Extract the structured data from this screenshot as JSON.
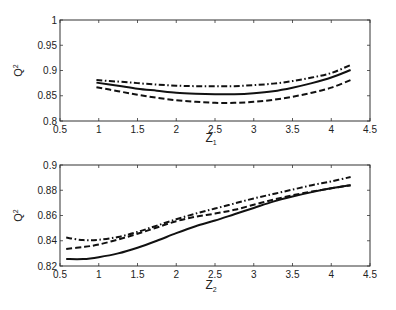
{
  "chart_data": [
    {
      "type": "line",
      "title": "",
      "xlabel": "Z",
      "xlabel_sub": "1",
      "ylabel": "Q",
      "ylabel_sup": "2",
      "xlim": [
        0.5,
        4.5
      ],
      "ylim": [
        0.8,
        1.0
      ],
      "xticks": [
        0.5,
        1,
        1.5,
        2,
        2.5,
        3,
        3.5,
        4,
        4.5
      ],
      "yticks": [
        0.8,
        0.85,
        0.9,
        0.95,
        1
      ],
      "xtick_labels": [
        "0.5",
        "1",
        "1.5",
        "2",
        "2.5",
        "3",
        "3.5",
        "4",
        "4.5"
      ],
      "ytick_labels": [
        "0.8",
        "0.85",
        "0.9",
        "0.95",
        "1"
      ],
      "grid": false,
      "legend": null,
      "x": [
        0.97,
        1.25,
        1.5,
        1.75,
        2.0,
        2.25,
        2.5,
        2.75,
        3.0,
        3.25,
        3.5,
        3.75,
        4.0,
        4.25
      ],
      "series": [
        {
          "name": "dash-dot",
          "style": "dashdot",
          "values": [
            0.881,
            0.878,
            0.875,
            0.872,
            0.87,
            0.869,
            0.869,
            0.869,
            0.871,
            0.874,
            0.879,
            0.886,
            0.895,
            0.911
          ]
        },
        {
          "name": "solid",
          "style": "solid",
          "values": [
            0.876,
            0.87,
            0.864,
            0.86,
            0.856,
            0.854,
            0.853,
            0.853,
            0.855,
            0.859,
            0.866,
            0.875,
            0.886,
            0.901
          ]
        },
        {
          "name": "dashed",
          "style": "dashed",
          "values": [
            0.867,
            0.859,
            0.852,
            0.846,
            0.841,
            0.838,
            0.836,
            0.836,
            0.838,
            0.842,
            0.848,
            0.856,
            0.866,
            0.881
          ]
        }
      ]
    },
    {
      "type": "line",
      "title": "",
      "xlabel": "Z",
      "xlabel_sub": "2",
      "ylabel": "Q",
      "ylabel_sup": "2",
      "xlim": [
        0.5,
        4.5
      ],
      "ylim": [
        0.82,
        0.9
      ],
      "xticks": [
        0.5,
        1,
        1.5,
        2,
        2.5,
        3,
        3.5,
        4,
        4.5
      ],
      "yticks": [
        0.82,
        0.84,
        0.86,
        0.88,
        0.9
      ],
      "xtick_labels": [
        "0.5",
        "1",
        "1.5",
        "2",
        "2.5",
        "3",
        "3.5",
        "4",
        "4.5"
      ],
      "ytick_labels": [
        "0.82",
        "0.84",
        "0.86",
        "0.88",
        "0.9"
      ],
      "grid": false,
      "legend": null,
      "x": [
        0.58,
        0.8,
        1.0,
        1.25,
        1.5,
        1.75,
        2.0,
        2.25,
        2.5,
        2.75,
        3.0,
        3.25,
        3.5,
        3.75,
        4.0,
        4.25
      ],
      "series": [
        {
          "name": "dash-dot",
          "style": "dashdot",
          "values": [
            0.8425,
            0.8405,
            0.8408,
            0.843,
            0.847,
            0.852,
            0.857,
            0.8615,
            0.8655,
            0.8695,
            0.8735,
            0.877,
            0.8805,
            0.884,
            0.887,
            0.8905
          ]
        },
        {
          "name": "dashed",
          "style": "dashed",
          "values": [
            0.8335,
            0.835,
            0.837,
            0.841,
            0.8455,
            0.8505,
            0.8555,
            0.859,
            0.8615,
            0.8645,
            0.8685,
            0.8725,
            0.876,
            0.879,
            0.8815,
            0.884
          ]
        },
        {
          "name": "solid",
          "style": "solid",
          "values": [
            0.8255,
            0.8255,
            0.827,
            0.83,
            0.8345,
            0.84,
            0.846,
            0.8515,
            0.856,
            0.861,
            0.866,
            0.871,
            0.875,
            0.8785,
            0.8815,
            0.884
          ]
        }
      ]
    }
  ]
}
